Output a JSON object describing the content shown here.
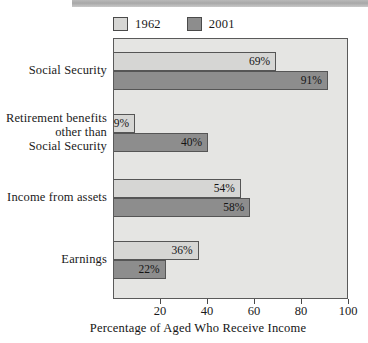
{
  "chart_data": {
    "type": "bar",
    "orientation": "horizontal",
    "title": "",
    "xlabel": "Percentage of Aged Who Receive Income",
    "ylabel": "",
    "xlim": [
      0,
      100
    ],
    "xticks": [
      20,
      40,
      60,
      80,
      100
    ],
    "grid": false,
    "legend_position": "top-left",
    "categories": [
      "Social Security",
      "Retirement benefits other than Social Security",
      "Income from assets",
      "Earnings"
    ],
    "series": [
      {
        "name": "1962",
        "color": "#d6d6d4",
        "values": [
          69,
          9,
          54,
          36
        ]
      },
      {
        "name": "2001",
        "color": "#8d8d8d",
        "values": [
          91,
          40,
          58,
          22
        ]
      }
    ],
    "value_suffix": "%"
  },
  "legend": {
    "entries": [
      {
        "label": "1962",
        "swatch": "legend-swatch-1962"
      },
      {
        "label": "2001",
        "swatch": "legend-swatch-2001"
      }
    ]
  },
  "categories_display": [
    {
      "lines": [
        "Social Security"
      ]
    },
    {
      "lines": [
        "Retirement benefits",
        "other than",
        "Social Security"
      ]
    },
    {
      "lines": [
        "Income from assets"
      ]
    },
    {
      "lines": [
        "Earnings"
      ]
    }
  ],
  "bars": [
    {
      "category": "Social Security",
      "series": "1962",
      "value": 69,
      "label": "69%"
    },
    {
      "category": "Social Security",
      "series": "2001",
      "value": 91,
      "label": "91%"
    },
    {
      "category": "Retirement benefits other than Social Security",
      "series": "1962",
      "value": 9,
      "label": "9%"
    },
    {
      "category": "Retirement benefits other than Social Security",
      "series": "2001",
      "value": 40,
      "label": "40%"
    },
    {
      "category": "Income from assets",
      "series": "1962",
      "value": 54,
      "label": "54%"
    },
    {
      "category": "Income from assets",
      "series": "2001",
      "value": 58,
      "label": "58%"
    },
    {
      "category": "Earnings",
      "series": "1962",
      "value": 36,
      "label": "36%"
    },
    {
      "category": "Earnings",
      "series": "2001",
      "value": 22,
      "label": "22%"
    }
  ],
  "axis": {
    "tick_labels": [
      "20",
      "40",
      "60",
      "80",
      "100"
    ],
    "title": "Percentage of Aged Who Receive Income"
  },
  "colors": {
    "series_1962": "#d6d6d4",
    "series_2001": "#8d8d8d",
    "plot_background": "#e5e5e3",
    "frame": "#5a5a5a",
    "text": "#1a1a1a"
  }
}
